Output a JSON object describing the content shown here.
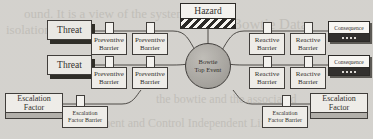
{
  "diagram": {
    "type": "bowtie-risk-diagram",
    "colors": {
      "page_background": "#cfcdc8",
      "node_fill": "#eceae5",
      "stroke": "#2b2825",
      "top_event_fill": "#9e9b95",
      "hazard_stripe": "#14120f",
      "escalation_base": "#a9a6a0",
      "consequence_base": "#1b1916"
    },
    "hazard": {
      "label": "Hazard"
    },
    "top_event": {
      "line1": "Bowtie",
      "line2": "Top Event"
    },
    "threats": [
      {
        "label": "Threat"
      },
      {
        "label": "Threat"
      }
    ],
    "preventive_barriers": [
      {
        "line1": "Preventive",
        "line2": "Barrier"
      },
      {
        "line1": "Preventive",
        "line2": "Barrier"
      },
      {
        "line1": "Preventive",
        "line2": "Barrier"
      },
      {
        "line1": "Preventive",
        "line2": "Barrier"
      }
    ],
    "reactive_barriers": [
      {
        "line1": "Reactive",
        "line2": "Barrier"
      },
      {
        "line1": "Reactive",
        "line2": "Barrier"
      },
      {
        "line1": "Reactive",
        "line2": "Barrier"
      },
      {
        "line1": "Reactive",
        "line2": "Barrier"
      }
    ],
    "consequences": [
      {
        "label": "Consequence"
      },
      {
        "label": "Consequence"
      }
    ],
    "escalation_factors": [
      {
        "line1": "Escalation",
        "line2": "Factor"
      },
      {
        "line1": "Escalation",
        "line2": "Factor"
      }
    ],
    "escalation_factor_barriers": [
      {
        "line1": "Escalation",
        "line2": "Factor Barrier"
      },
      {
        "line1": "Escalation",
        "line2": "Factor Barrier"
      }
    ]
  },
  "background_text": {
    "line_top_a": "ound. It is a view of the system from the",
    "line_top_b": "isolation",
    "line_mid": "Bowtie Data",
    "line_low_a": "essment and Control Independent Life",
    "line_low_b": "the bowtie and the associated"
  }
}
